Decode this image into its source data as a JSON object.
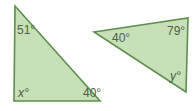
{
  "figure": {
    "colors": {
      "fill": "#c8e0b8",
      "stroke": "#5e8f4c",
      "text": "#4d5f47"
    },
    "triangles": [
      {
        "name": "left-triangle",
        "angles": {
          "top": "51°",
          "bottom_left": "x°",
          "bottom_right": "40°"
        }
      },
      {
        "name": "right-triangle",
        "angles": {
          "left": "40°",
          "top_right": "79°",
          "bottom_right": "y°"
        }
      }
    ]
  }
}
